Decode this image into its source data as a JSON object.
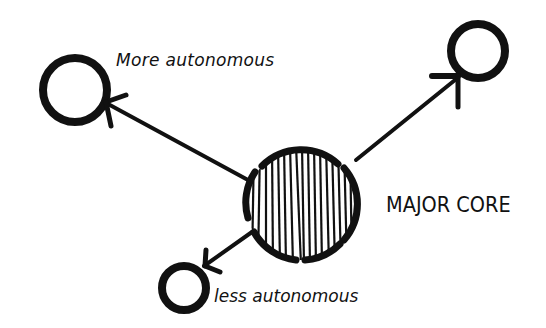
{
  "diagram": {
    "style": "hand-drawn sketch",
    "ink_color": "#111111",
    "background": "#ffffff",
    "nodes": [
      {
        "id": "core",
        "label": "MAJOR CORE",
        "shape": "circle",
        "fill": "vertical hatching",
        "size": "large"
      },
      {
        "id": "top-left",
        "label": "More autonomous",
        "shape": "circle",
        "fill": "none",
        "size": "medium"
      },
      {
        "id": "top-right",
        "label": "",
        "shape": "circle",
        "fill": "none",
        "size": "medium"
      },
      {
        "id": "bottom-left",
        "label": "less autonomous",
        "shape": "circle",
        "fill": "none",
        "size": "small"
      }
    ],
    "edges": [
      {
        "from": "core",
        "to": "top-left",
        "arrow": "to"
      },
      {
        "from": "core",
        "to": "top-right",
        "arrow": "to"
      },
      {
        "from": "core",
        "to": "bottom-left",
        "arrow": "to"
      }
    ]
  },
  "labels": {
    "more": "More autonomous",
    "core": "MAJOR CORE",
    "less": "less autonomous"
  }
}
